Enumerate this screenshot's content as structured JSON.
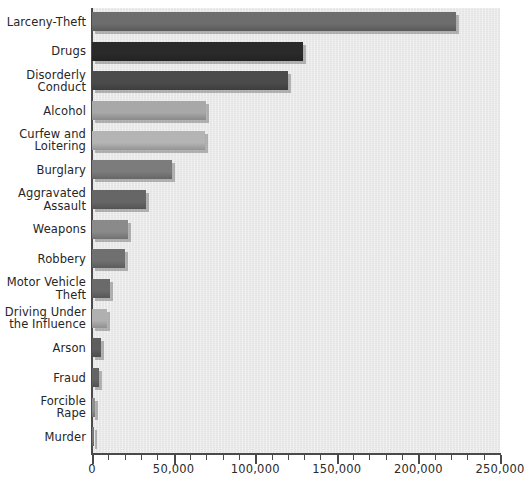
{
  "chart_data": {
    "type": "bar",
    "orientation": "horizontal",
    "title": "",
    "xlabel": "",
    "ylabel": "",
    "xlim": [
      0,
      250000
    ],
    "grid": false,
    "legend": null,
    "major_tick_step": 50000,
    "minor_tick_step": 10000,
    "xticklabels": [
      "0",
      "50,000",
      "100,000",
      "150,000",
      "200,000",
      "250,000"
    ],
    "xticks": [
      0,
      50000,
      100000,
      150000,
      200000,
      250000
    ],
    "categories": [
      "Larceny-Theft",
      "Drugs",
      "Disorderly\nConduct",
      "Alcohol",
      "Curfew and\nLoitering",
      "Burglary",
      "Aggravated\nAssault",
      "Weapons",
      "Robbery",
      "Motor Vehicle\nTheft",
      "Driving Under\nthe Influence",
      "Arson",
      "Fraud",
      "Forcible\nRape",
      "Murder"
    ],
    "values": [
      223000,
      129000,
      120000,
      70000,
      69000,
      49000,
      33000,
      22000,
      20000,
      11000,
      9000,
      5500,
      4500,
      2000,
      700
    ],
    "bar_colors": [
      "#6d6d6d",
      "#2a2a2a",
      "#4b4b4b",
      "#a8a8a8",
      "#b4b4b4",
      "#7c7c7c",
      "#666666",
      "#8a8a8a",
      "#707070",
      "#6a6a6a",
      "#b0b0b0",
      "#5e5e5e",
      "#646464",
      "#8e8e8e",
      "#7a7a7a"
    ],
    "plot_background": "#eaeaea",
    "axis_color": "#4a4a4a",
    "text_color": "#262626"
  }
}
